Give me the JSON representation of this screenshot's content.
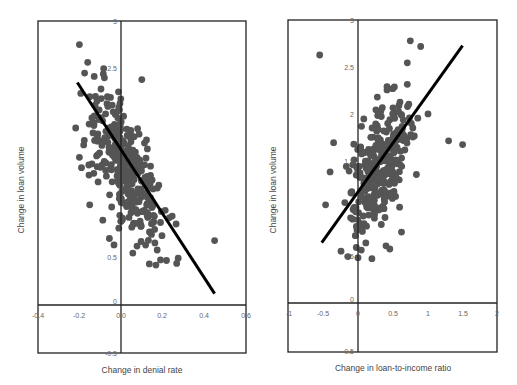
{
  "chart_data": [
    {
      "type": "scatter",
      "title": "",
      "xlabel": "Change in denial rate",
      "ylabel": "Change in loan volume",
      "xlim": [
        -0.4,
        0.6
      ],
      "ylim": [
        -0.5,
        3
      ],
      "x_ticks": [
        "-0.4",
        "-0.2",
        "0.0",
        "0.2",
        "0.4",
        "0.6"
      ],
      "y_ticks": [
        "-0.5",
        "0",
        "0.5",
        "2.5",
        "3"
      ],
      "grid": false,
      "point_color": "#555555",
      "trend_line": {
        "x": [
          -0.21,
          0.45
        ],
        "y": [
          2.35,
          0.12
        ]
      },
      "cluster": {
        "center_x": 0.02,
        "center_y": 1.45,
        "spread_x": 0.09,
        "spread_y": 0.42,
        "slope": -3.3,
        "n": 330
      },
      "outliers": [
        [
          0.45,
          0.68
        ],
        [
          0.1,
          2.38
        ],
        [
          -0.2,
          1.56
        ],
        [
          -0.2,
          2.75
        ],
        [
          0.12,
          1.55
        ],
        [
          -0.11,
          1.3
        ],
        [
          -0.19,
          1.45
        ]
      ]
    },
    {
      "type": "scatter",
      "title": "",
      "xlabel": "Change in loan-to-income ratio",
      "ylabel": "Change in loan volume",
      "xlim": [
        -1,
        2
      ],
      "ylim": [
        -0.5,
        3
      ],
      "x_ticks": [
        "-1",
        "-0.5",
        "0",
        "0.5",
        "1",
        "1.5",
        "2"
      ],
      "y_ticks": [
        "-0.5",
        "0",
        "0.5",
        "1.5",
        "2",
        "2.5",
        "3"
      ],
      "grid": false,
      "point_color": "#555555",
      "trend_line": {
        "x": [
          -0.52,
          1.5
        ],
        "y": [
          0.64,
          2.73
        ]
      },
      "cluster": {
        "center_x": 0.3,
        "center_y": 1.45,
        "spread_x": 0.22,
        "spread_y": 0.4,
        "slope": 0.9,
        "n": 330
      },
      "outliers": [
        [
          -0.55,
          2.63
        ],
        [
          -0.35,
          1.7
        ],
        [
          -0.4,
          1.39
        ],
        [
          1.5,
          1.68
        ],
        [
          1.3,
          1.72
        ],
        [
          0.9,
          2.72
        ],
        [
          0.75,
          2.78
        ],
        [
          0.0,
          0.48
        ],
        [
          0.2,
          0.47
        ]
      ]
    }
  ]
}
